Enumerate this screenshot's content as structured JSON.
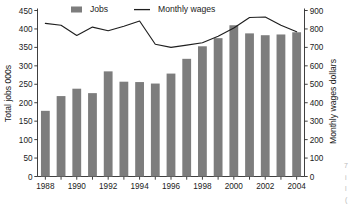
{
  "chart_data": {
    "type": "bar",
    "title": "",
    "subtitle": "",
    "xlabel": "",
    "ylabel": "Total jobs 000s",
    "y2label": "Monthly wages dollars",
    "grid": false,
    "legend_position": "top",
    "categories": [
      "1988",
      "1989",
      "1990",
      "1991",
      "1992",
      "1993",
      "1994",
      "1995",
      "1996",
      "1997",
      "1998",
      "1999",
      "2000",
      "2001",
      "2002",
      "2003",
      "2004"
    ],
    "x_tick_labels": [
      "1988",
      "1990",
      "1992",
      "1994",
      "1996",
      "1998",
      "2000",
      "2002",
      "2004"
    ],
    "ylim": [
      0,
      450
    ],
    "y_ticks": [
      0,
      50,
      100,
      150,
      200,
      250,
      300,
      350,
      400,
      450
    ],
    "y2lim": [
      0,
      900
    ],
    "y2_ticks": [
      0,
      100,
      200,
      300,
      400,
      500,
      600,
      700,
      800,
      900
    ],
    "series": [
      {
        "name": "Jobs",
        "type": "bar",
        "axis": "left",
        "color": "#7d7d7d",
        "values": [
          178,
          218,
          238,
          226,
          285,
          257,
          256,
          252,
          279,
          319,
          353,
          375,
          410,
          388,
          383,
          385,
          391
        ]
      },
      {
        "name": "Monthly wages",
        "type": "line",
        "axis": "right",
        "color": "#1f1f1f",
        "values": [
          830,
          820,
          765,
          810,
          790,
          815,
          843,
          717,
          700,
          712,
          725,
          760,
          805,
          862,
          865,
          820,
          785
        ]
      }
    ]
  },
  "legend": {
    "items": [
      {
        "label": "Jobs",
        "marker": "square",
        "color": "#7d7d7d"
      },
      {
        "label": "Monthly wages",
        "marker": "line",
        "color": "#1f1f1f"
      }
    ]
  },
  "axes": {
    "left_title": "Total jobs 000s",
    "right_title": "Monthly wages dollars"
  },
  "edge_fragments": {
    "line1": "7",
    "line2": "i",
    "line3": "l",
    "line4": "("
  }
}
